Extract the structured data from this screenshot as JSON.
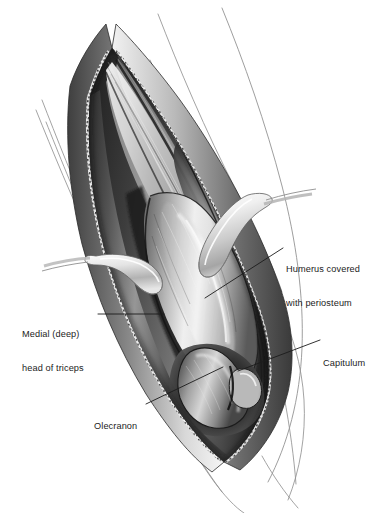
{
  "figure": {
    "medium": "grayscale anatomical line-and-wash illustration",
    "background_color": "#ffffff",
    "ink_color": "#1c1c1c"
  },
  "annotations": [
    {
      "id": "humerus",
      "name": "humerus-covered-with-periosteum",
      "line1": "Humerus covered",
      "line2": "with periosteum",
      "leader": {
        "x1": 283,
        "y1": 248,
        "x2": 205,
        "y2": 298
      }
    },
    {
      "id": "triceps",
      "name": "medial-deep-head-of-triceps",
      "line1": "Medial (deep)",
      "line2": "head of triceps",
      "leader": {
        "x1": 98,
        "y1": 314,
        "x2": 164,
        "y2": 314
      }
    },
    {
      "id": "capitulum",
      "name": "capitulum",
      "line1": "Capitulum",
      "line2": "",
      "leader": {
        "x1": 320,
        "y1": 340,
        "x2": 238,
        "y2": 371
      }
    },
    {
      "id": "olecranon",
      "name": "olecranon",
      "line1": "Olecranon",
      "line2": "",
      "leader": {
        "x1": 146,
        "y1": 404,
        "x2": 223,
        "y2": 367
      }
    }
  ],
  "structures": {
    "wound": "longitudinal posterior incision held open, skin edges stippled",
    "retractor_proximal": "blunt hand-held retractor blade, upper right of wound",
    "retractor_distal": "blunt hand-held retractor blade, left mid wound",
    "bone_shaft": "humeral shaft with overlying periosteum",
    "distal_bone": "olecranon process and capitulum at distal end",
    "muscle": "split triceps muscle bellies lining the wound",
    "limb_outline": "thin sketched contour lines of the arm and forearm"
  }
}
